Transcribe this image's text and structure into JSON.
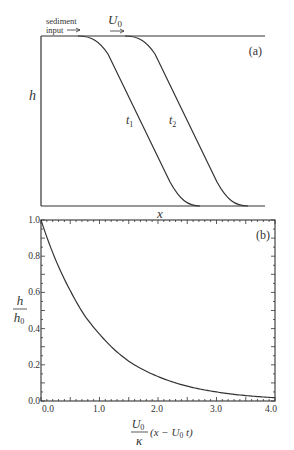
{
  "panel_a": {
    "label": "(a)",
    "annotation_line1": "sediment",
    "annotation_line2": "input",
    "velocity_label": "U",
    "velocity_sub": "0",
    "ylabel": "h",
    "xlabel": "x",
    "curve_labels": [
      {
        "name": "t",
        "sub": "1"
      },
      {
        "name": "t",
        "sub": "2"
      }
    ]
  },
  "panel_b": {
    "label": "(b)",
    "ylabel_num": "h",
    "ylabel_den": "h",
    "ylabel_den_sub": "0",
    "xlabel_frac_num": "U",
    "xlabel_frac_num_sub": "0",
    "xlabel_frac_den": "κ",
    "xlabel_rest": "(x − U",
    "xlabel_rest_sub": "0",
    "xlabel_rest_end": " t)",
    "yticks": [
      "0.0",
      "0.2",
      "0.4",
      "0.6",
      "0.8",
      "1.0"
    ],
    "xticks": [
      "0.0",
      "1.0",
      "2.0",
      "3.0",
      "4.0"
    ]
  },
  "chart_data": [
    {
      "type": "line",
      "title": "(a)",
      "xlabel": "x",
      "ylabel": "h",
      "annotations": [
        "sediment input →",
        "U0 →",
        "t1",
        "t2"
      ],
      "series": [
        {
          "name": "t1",
          "description": "plateau at h0, smooth decline to 0 (front at earlier time)"
        },
        {
          "name": "t2",
          "description": "same profile translated downstream by U0 (t2 − t1)"
        }
      ]
    },
    {
      "type": "line",
      "title": "(b)",
      "xlabel": "U0/κ (x − U0 t)",
      "ylabel": "h/h0",
      "xlim": [
        0,
        4
      ],
      "ylim": [
        0,
        1
      ],
      "x": [
        0.0,
        0.25,
        0.5,
        0.75,
        1.0,
        1.5,
        2.0,
        2.5,
        3.0,
        3.5,
        4.0
      ],
      "series": [
        {
          "name": "h/h0",
          "values": [
            1.0,
            0.78,
            0.61,
            0.47,
            0.37,
            0.22,
            0.135,
            0.082,
            0.05,
            0.03,
            0.018
          ]
        }
      ]
    }
  ]
}
